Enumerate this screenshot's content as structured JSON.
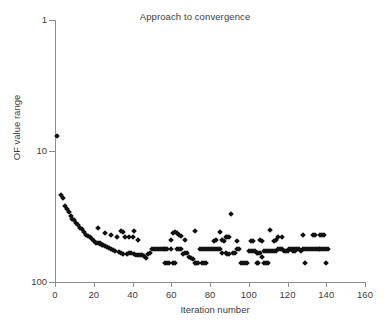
{
  "chart": {
    "title": "Approach to convergence",
    "xlabel": "Iteration number",
    "ylabel": "OF value range"
  },
  "axes": {
    "x_ticks": [
      "0",
      "20",
      "40",
      "60",
      "80",
      "100",
      "120",
      "140",
      "160"
    ],
    "y_ticks": [
      "100",
      "10",
      "1"
    ]
  },
  "chart_data": {
    "type": "scatter",
    "title": "Approach to convergence",
    "xlabel": "Iteration number",
    "ylabel": "OF value range",
    "xlim": [
      0,
      160
    ],
    "ylim": [
      1,
      100
    ],
    "yscale": "log",
    "xscale": "linear",
    "grid": false,
    "legend": null,
    "marker": "diamond",
    "marker_color": "#111111",
    "xticks": [
      0,
      20,
      40,
      60,
      80,
      100,
      120,
      140,
      160
    ],
    "yticks": [
      1,
      10,
      100
    ],
    "series": [
      {
        "name": "OF value range",
        "points": [
          [
            1,
            13.0
          ],
          [
            3,
            4.6
          ],
          [
            4,
            4.4
          ],
          [
            5,
            3.8
          ],
          [
            6,
            3.6
          ],
          [
            7,
            3.4
          ],
          [
            8,
            3.2
          ],
          [
            9,
            3.05
          ],
          [
            10,
            2.95
          ],
          [
            11,
            2.8
          ],
          [
            12,
            2.7
          ],
          [
            13,
            2.6
          ],
          [
            14,
            2.52
          ],
          [
            15,
            2.42
          ],
          [
            16,
            2.3
          ],
          [
            17,
            2.25
          ],
          [
            18,
            2.2
          ],
          [
            19,
            2.12
          ],
          [
            20,
            2.05
          ],
          [
            21,
            2.0
          ],
          [
            22,
            1.98
          ],
          [
            23,
            1.95
          ],
          [
            24,
            1.93
          ],
          [
            25,
            1.9
          ],
          [
            26,
            1.88
          ],
          [
            27,
            1.85
          ],
          [
            28,
            1.82
          ],
          [
            22,
            2.6
          ],
          [
            23,
            2.0
          ],
          [
            26,
            2.35
          ],
          [
            29,
            1.78
          ],
          [
            30,
            1.75
          ],
          [
            31,
            1.72
          ],
          [
            29,
            2.3
          ],
          [
            32,
            2.2
          ],
          [
            33,
            1.68
          ],
          [
            34,
            1.66
          ],
          [
            35,
            1.65
          ],
          [
            34,
            2.45
          ],
          [
            35,
            2.42
          ],
          [
            36,
            2.2
          ],
          [
            37,
            1.65
          ],
          [
            38,
            1.67
          ],
          [
            39,
            1.66
          ],
          [
            38,
            2.2
          ],
          [
            40,
            2.2
          ],
          [
            41,
            1.63
          ],
          [
            42,
            1.62
          ],
          [
            43,
            1.62
          ],
          [
            41,
            2.45
          ],
          [
            43,
            2.1
          ],
          [
            44,
            1.6
          ],
          [
            45,
            1.6
          ],
          [
            46,
            1.58
          ],
          [
            47,
            1.52
          ],
          [
            48,
            1.65
          ],
          [
            49,
            1.66
          ],
          [
            50,
            1.78
          ],
          [
            51,
            1.78
          ],
          [
            52,
            1.78
          ],
          [
            53,
            1.78
          ],
          [
            54,
            1.78
          ],
          [
            55,
            1.78
          ],
          [
            56,
            1.78
          ],
          [
            57,
            1.78
          ],
          [
            58,
            1.78
          ],
          [
            57,
            1.4
          ],
          [
            58,
            1.4
          ],
          [
            59,
            1.4
          ],
          [
            60,
            1.78
          ],
          [
            61,
            1.4
          ],
          [
            62,
            1.4
          ],
          [
            60,
            2.1
          ],
          [
            61,
            2.35
          ],
          [
            62,
            2.4
          ],
          [
            63,
            1.78
          ],
          [
            64,
            1.78
          ],
          [
            65,
            1.78
          ],
          [
            63,
            2.35
          ],
          [
            64,
            2.3
          ],
          [
            65,
            2.25
          ],
          [
            66,
            1.65
          ],
          [
            67,
            1.66
          ],
          [
            68,
            1.66
          ],
          [
            67,
            2.1
          ],
          [
            69,
            1.55
          ],
          [
            70,
            1.52
          ],
          [
            71,
            1.5
          ],
          [
            72,
            1.4
          ],
          [
            73,
            1.4
          ],
          [
            74,
            1.4
          ],
          [
            72,
            2.45
          ],
          [
            75,
            1.78
          ],
          [
            76,
            1.78
          ],
          [
            77,
            1.78
          ],
          [
            78,
            1.78
          ],
          [
            79,
            1.78
          ],
          [
            80,
            1.78
          ],
          [
            76,
            1.4
          ],
          [
            77,
            1.4
          ],
          [
            78,
            1.4
          ],
          [
            81,
            1.78
          ],
          [
            82,
            1.78
          ],
          [
            83,
            1.78
          ],
          [
            82,
            2.05
          ],
          [
            83,
            2.1
          ],
          [
            84,
            1.78
          ],
          [
            85,
            1.78
          ],
          [
            86,
            1.66
          ],
          [
            85,
            2.4
          ],
          [
            86,
            2.1
          ],
          [
            87,
            2.05
          ],
          [
            88,
            1.66
          ],
          [
            89,
            1.65
          ],
          [
            90,
            1.65
          ],
          [
            88,
            2.2
          ],
          [
            89,
            2.2
          ],
          [
            90,
            2.2
          ],
          [
            91,
            3.3
          ],
          [
            92,
            1.66
          ],
          [
            93,
            1.66
          ],
          [
            94,
            1.78
          ],
          [
            95,
            1.78
          ],
          [
            96,
            1.4
          ],
          [
            97,
            1.4
          ],
          [
            94,
            2.05
          ],
          [
            98,
            1.4
          ],
          [
            99,
            1.4
          ],
          [
            100,
            1.72
          ],
          [
            101,
            1.72
          ],
          [
            102,
            1.72
          ],
          [
            103,
            1.72
          ],
          [
            101,
            2.05
          ],
          [
            102,
            2.05
          ],
          [
            104,
            1.66
          ],
          [
            105,
            1.66
          ],
          [
            106,
            1.66
          ],
          [
            104,
            1.4
          ],
          [
            105,
            1.4
          ],
          [
            106,
            2.1
          ],
          [
            107,
            2.05
          ],
          [
            107,
            1.55
          ],
          [
            108,
            1.72
          ],
          [
            109,
            1.72
          ],
          [
            108,
            1.4
          ],
          [
            109,
            1.4
          ],
          [
            110,
            1.4
          ],
          [
            110,
            1.72
          ],
          [
            111,
            1.72
          ],
          [
            112,
            1.72
          ],
          [
            111,
            2.5
          ],
          [
            113,
            1.72
          ],
          [
            114,
            1.72
          ],
          [
            115,
            1.78
          ],
          [
            113,
            2.05
          ],
          [
            114,
            2.1
          ],
          [
            115,
            2.2
          ],
          [
            116,
            1.78
          ],
          [
            117,
            1.78
          ],
          [
            118,
            1.72
          ],
          [
            117,
            2.2
          ],
          [
            119,
            1.72
          ],
          [
            120,
            1.72
          ],
          [
            121,
            1.78
          ],
          [
            122,
            1.78
          ],
          [
            123,
            1.78
          ],
          [
            124,
            1.78
          ],
          [
            123,
            1.72
          ],
          [
            124,
            1.72
          ],
          [
            125,
            1.78
          ],
          [
            126,
            1.78
          ],
          [
            127,
            1.72
          ],
          [
            128,
            1.78
          ],
          [
            129,
            1.78
          ],
          [
            130,
            1.78
          ],
          [
            129,
            1.4
          ],
          [
            128,
            2.3
          ],
          [
            131,
            1.78
          ],
          [
            132,
            1.78
          ],
          [
            133,
            1.78
          ],
          [
            134,
            1.78
          ],
          [
            135,
            1.78
          ],
          [
            133,
            2.3
          ],
          [
            134,
            2.3
          ],
          [
            136,
            1.78
          ],
          [
            137,
            1.78
          ],
          [
            138,
            1.78
          ],
          [
            137,
            2.3
          ],
          [
            138,
            2.3
          ],
          [
            139,
            2.3
          ],
          [
            139,
            1.78
          ],
          [
            140,
            1.78
          ],
          [
            141,
            1.78
          ],
          [
            140,
            1.4
          ]
        ]
      }
    ]
  }
}
